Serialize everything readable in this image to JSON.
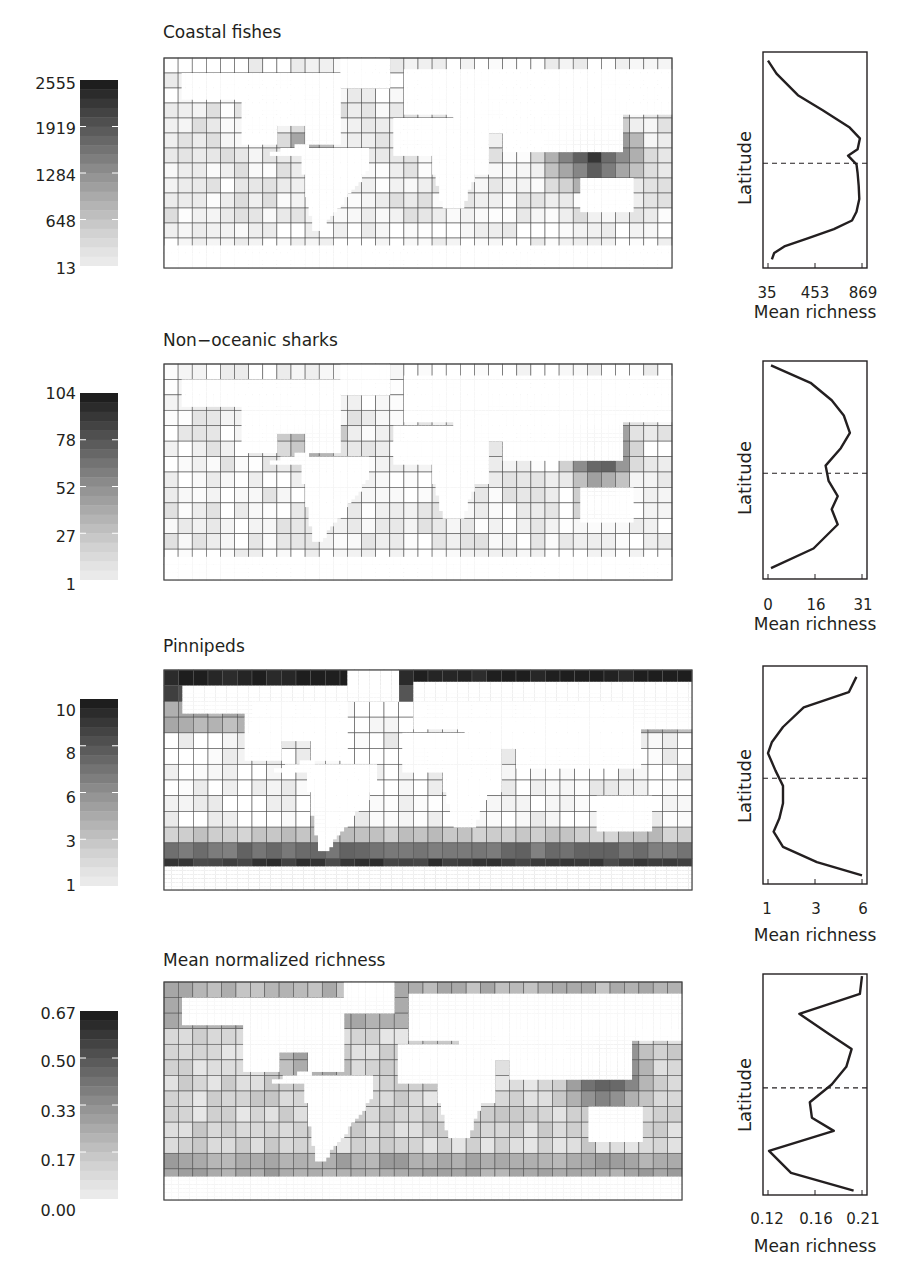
{
  "chart_data": [
    {
      "type": "heatmap",
      "title": "Coastal fishes",
      "colorbar": {
        "ticks": [
          "2555",
          "1919",
          "1284",
          "648",
          "13"
        ],
        "min": 13,
        "max": 2555
      },
      "grid": {
        "cols": 36,
        "rows": 14
      },
      "profile": {
        "type": "line",
        "xlabel": "Mean richness",
        "ylabel": "Latitude",
        "xticks": [
          "35",
          "453",
          "869"
        ],
        "xlim": [
          35,
          869
        ],
        "equator_line": true,
        "points_x": [
          35,
          110,
          300,
          520,
          760,
          850,
          830,
          745,
          820,
          830,
          840,
          845,
          820,
          780,
          620,
          400,
          180,
          90,
          70
        ],
        "points_y": [
          0.04,
          0.1,
          0.2,
          0.27,
          0.35,
          0.4,
          0.45,
          0.48,
          0.52,
          0.56,
          0.62,
          0.68,
          0.74,
          0.78,
          0.82,
          0.86,
          0.9,
          0.93,
          0.96
        ]
      }
    },
    {
      "type": "heatmap",
      "title": "Non−oceanic sharks",
      "colorbar": {
        "ticks": [
          "104",
          "78",
          "52",
          "27",
          "1"
        ],
        "min": 1,
        "max": 104
      },
      "grid": {
        "cols": 36,
        "rows": 14
      },
      "profile": {
        "type": "line",
        "xlabel": "Mean richness",
        "ylabel": "Latitude",
        "xticks": [
          "0",
          "16",
          "31"
        ],
        "xlim": [
          0,
          31
        ],
        "equator_line": true,
        "points_x": [
          1,
          14,
          21,
          25,
          27,
          24,
          19,
          20,
          23,
          21,
          23,
          15,
          1
        ],
        "points_y": [
          0.02,
          0.1,
          0.18,
          0.25,
          0.33,
          0.4,
          0.48,
          0.55,
          0.62,
          0.68,
          0.75,
          0.86,
          0.95
        ]
      }
    },
    {
      "type": "heatmap",
      "title": "Pinnipeds",
      "colorbar": {
        "ticks": [
          "10",
          "8",
          "6",
          "3",
          "1"
        ],
        "min": 1,
        "max": 10
      },
      "grid": {
        "cols": 36,
        "rows": 14
      },
      "profile": {
        "type": "line",
        "xlabel": "Mean richness",
        "ylabel": "Latitude",
        "xticks": [
          "1",
          "3",
          "6"
        ],
        "xlim": [
          1,
          6
        ],
        "equator_line": true,
        "points_x": [
          5.7,
          5.3,
          2.9,
          1.8,
          1.2,
          1.0,
          1.4,
          1.8,
          1.8,
          1.6,
          1.3,
          1.8,
          3.6,
          6.0
        ],
        "points_y": [
          0.05,
          0.12,
          0.19,
          0.28,
          0.35,
          0.4,
          0.48,
          0.55,
          0.63,
          0.7,
          0.76,
          0.83,
          0.9,
          0.96
        ]
      }
    },
    {
      "type": "heatmap",
      "title": "Mean normalized richness",
      "colorbar": {
        "ticks": [
          "0.67",
          "0.50",
          "0.33",
          "0.17",
          "0.00"
        ],
        "min": 0.0,
        "max": 0.67
      },
      "grid": {
        "cols": 36,
        "rows": 14
      },
      "profile": {
        "type": "line",
        "xlabel": "Mean richness",
        "ylabel": "Latitude",
        "xticks": [
          "0.12",
          "0.16",
          "0.21"
        ],
        "xlim": [
          0.12,
          0.21
        ],
        "equator_line": true,
        "points_x": [
          0.21,
          0.208,
          0.15,
          0.178,
          0.2,
          0.195,
          0.181,
          0.16,
          0.162,
          0.183,
          0.121,
          0.142,
          0.202
        ],
        "points_y": [
          0.01,
          0.09,
          0.18,
          0.27,
          0.34,
          0.42,
          0.5,
          0.58,
          0.65,
          0.71,
          0.8,
          0.9,
          0.98
        ]
      }
    }
  ],
  "panels": [
    {
      "title": "Coastal fishes",
      "cb": [
        "2555",
        "1919",
        "1284",
        "648",
        "13"
      ],
      "xt": [
        "35",
        "453",
        "869"
      ],
      "xlabel": "Mean richness",
      "ylabel": "Latitude"
    },
    {
      "title": "Non−oceanic sharks",
      "cb": [
        "104",
        "78",
        "52",
        "27",
        "1"
      ],
      "xt": [
        "0",
        "16",
        "31"
      ],
      "xlabel": "Mean richness",
      "ylabel": "Latitude"
    },
    {
      "title": "Pinnipeds",
      "cb": [
        "10",
        "8",
        "6",
        "3",
        "1"
      ],
      "xt": [
        "1",
        "3",
        "6"
      ],
      "xlabel": "Mean richness",
      "ylabel": "Latitude"
    },
    {
      "title": "Mean normalized richness",
      "cb": [
        "0.67",
        "0.50",
        "0.33",
        "0.17",
        "0.00"
      ],
      "xt": [
        "0.12",
        "0.16",
        "0.21"
      ],
      "xlabel": "Mean richness",
      "ylabel": "Latitude"
    }
  ]
}
